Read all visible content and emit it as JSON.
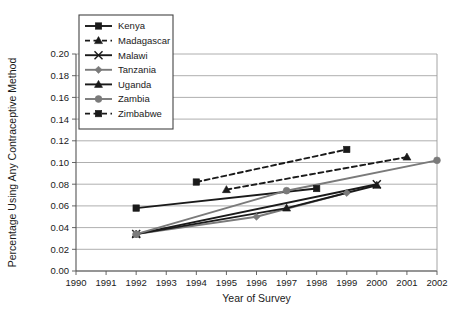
{
  "chart_data": {
    "type": "line",
    "title": "",
    "xlabel": "Year of Survey",
    "ylabel": "Percentage Using Any Contraceptive Method",
    "xlim": [
      1990,
      2002
    ],
    "ylim": [
      0.0,
      0.2
    ],
    "grid": true,
    "legend_position": "top-left",
    "xticks": [
      "1990",
      "1991",
      "1992",
      "1993",
      "1994",
      "1995",
      "1996",
      "1997",
      "1998",
      "1999",
      "2000",
      "2001",
      "2002"
    ],
    "yticks": [
      "0.00",
      "0.02",
      "0.04",
      "0.06",
      "0.08",
      "0.10",
      "0.12",
      "0.14",
      "0.16",
      "0.18",
      "0.20"
    ],
    "series": [
      {
        "name": "Kenya",
        "marker": "square",
        "color": "#1a1a1a",
        "dash": "solid",
        "x": [
          1992,
          1998
        ],
        "y": [
          0.058,
          0.076
        ]
      },
      {
        "name": "Madagascar",
        "marker": "triangle",
        "color": "#1a1a1a",
        "dash": "dashed",
        "x": [
          1995,
          2001
        ],
        "y": [
          0.075,
          0.105
        ]
      },
      {
        "name": "Malawi",
        "marker": "x",
        "color": "#1a1a1a",
        "dash": "solid",
        "x": [
          1992,
          2000
        ],
        "y": [
          0.034,
          0.08
        ]
      },
      {
        "name": "Tanzania",
        "marker": "diamond",
        "color": "#7a7a7a",
        "dash": "solid",
        "x": [
          1992,
          1996,
          1999
        ],
        "y": [
          0.034,
          0.05,
          0.072
        ]
      },
      {
        "name": "Uganda",
        "marker": "triangle",
        "color": "#1a1a1a",
        "dash": "solid",
        "x": [
          1992,
          1997,
          2000
        ],
        "y": [
          0.034,
          0.058,
          0.079
        ]
      },
      {
        "name": "Zambia",
        "marker": "circle",
        "color": "#7a7a7a",
        "dash": "solid",
        "x": [
          1992,
          1997,
          2002
        ],
        "y": [
          0.034,
          0.074,
          0.102
        ]
      },
      {
        "name": "Zimbabwe",
        "marker": "square",
        "color": "#1a1a1a",
        "dash": "dashed",
        "x": [
          1994,
          1999
        ],
        "y": [
          0.082,
          0.112
        ]
      }
    ]
  },
  "legend": {
    "items": [
      {
        "label": "Kenya"
      },
      {
        "label": "Madagascar"
      },
      {
        "label": "Malawi"
      },
      {
        "label": "Tanzania"
      },
      {
        "label": "Uganda"
      },
      {
        "label": "Zambia"
      },
      {
        "label": "Zimbabwe"
      }
    ]
  }
}
